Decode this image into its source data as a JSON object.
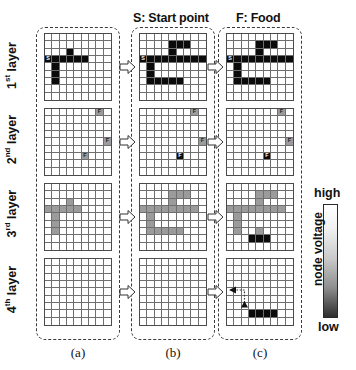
{
  "figure": {
    "top_captions": {
      "start": "S: Start point",
      "food": "F: Food"
    },
    "row_labels": [
      {
        "ordinal": "1",
        "suffix": "st",
        "text": " layer"
      },
      {
        "ordinal": "2",
        "suffix": "nd",
        "text": " layer"
      },
      {
        "ordinal": "3",
        "suffix": "rd",
        "text": " layer"
      },
      {
        "ordinal": "4",
        "suffix": "th",
        "text": " layer"
      }
    ],
    "bottom_captions": [
      "(a)",
      "(b)",
      "(c)"
    ],
    "legend": {
      "high_label": "high",
      "low_label": "low",
      "title": "node voltage",
      "high_color": "#ffffff",
      "low_color": "#2e2e2e"
    },
    "colors": {
      "black": "#0b0b0b",
      "gray": "#9b9b9b",
      "white": "#ffffff",
      "dashed_border": "#3a3a3a",
      "grid_line": "#6f6f6f"
    },
    "grid_size": {
      "cols": 9,
      "rows": 9
    },
    "marker_labels": {
      "start": "S",
      "food": "F"
    }
  },
  "grids": {
    "a1": {
      "name": "column-a-layer-1",
      "black": [
        [
          3,
          0
        ],
        [
          3,
          1
        ],
        [
          3,
          2
        ],
        [
          3,
          3
        ],
        [
          3,
          4
        ],
        [
          3,
          5
        ],
        [
          2,
          3
        ],
        [
          4,
          1
        ],
        [
          5,
          1
        ],
        [
          6,
          1
        ]
      ],
      "gray": [],
      "markers": [
        {
          "r": 3,
          "c": 0,
          "label": "S"
        }
      ]
    },
    "a2": {
      "name": "column-a-layer-2",
      "black": [],
      "gray": [
        [
          0,
          7
        ],
        [
          4,
          8
        ],
        [
          6,
          5
        ]
      ],
      "markers": [
        {
          "r": 0,
          "c": 7,
          "label": "F"
        },
        {
          "r": 4,
          "c": 8,
          "label": "F"
        },
        {
          "r": 6,
          "c": 5,
          "label": "F"
        }
      ]
    },
    "a3": {
      "name": "column-a-layer-3",
      "black": [],
      "gray": [
        [
          3,
          0
        ],
        [
          3,
          1
        ],
        [
          3,
          2
        ],
        [
          3,
          3
        ],
        [
          3,
          4
        ],
        [
          2,
          3
        ],
        [
          4,
          1
        ],
        [
          5,
          1
        ],
        [
          6,
          1
        ]
      ],
      "markers": []
    },
    "a4": {
      "name": "column-a-layer-4",
      "black": [],
      "gray": [],
      "markers": []
    },
    "b1": {
      "name": "column-b-layer-1",
      "black": [
        [
          1,
          4
        ],
        [
          1,
          5
        ],
        [
          1,
          6
        ],
        [
          2,
          4
        ],
        [
          3,
          0
        ],
        [
          3,
          1
        ],
        [
          3,
          2
        ],
        [
          3,
          3
        ],
        [
          3,
          4
        ],
        [
          3,
          5
        ],
        [
          3,
          6
        ],
        [
          3,
          7
        ],
        [
          3,
          8
        ],
        [
          4,
          1
        ],
        [
          5,
          1
        ],
        [
          6,
          1
        ],
        [
          6,
          2
        ],
        [
          6,
          3
        ],
        [
          6,
          4
        ],
        [
          6,
          5
        ]
      ],
      "gray": [],
      "markers": [
        {
          "r": 3,
          "c": 0,
          "label": "S"
        }
      ]
    },
    "b2": {
      "name": "column-b-layer-2",
      "black": [
        [
          6,
          5
        ]
      ],
      "gray": [
        [
          0,
          7
        ],
        [
          4,
          8
        ]
      ],
      "markers": [
        {
          "r": 0,
          "c": 7,
          "label": "F"
        },
        {
          "r": 4,
          "c": 8,
          "label": "F"
        },
        {
          "r": 6,
          "c": 5,
          "label": "F"
        }
      ]
    },
    "b3": {
      "name": "column-b-layer-3",
      "black": [],
      "gray": [
        [
          1,
          4
        ],
        [
          1,
          5
        ],
        [
          1,
          6
        ],
        [
          2,
          4
        ],
        [
          3,
          0
        ],
        [
          3,
          1
        ],
        [
          3,
          2
        ],
        [
          3,
          3
        ],
        [
          3,
          4
        ],
        [
          3,
          5
        ],
        [
          3,
          6
        ],
        [
          3,
          7
        ],
        [
          4,
          1
        ],
        [
          5,
          1
        ],
        [
          6,
          1
        ],
        [
          6,
          2
        ],
        [
          6,
          3
        ],
        [
          6,
          4
        ],
        [
          6,
          5
        ]
      ],
      "markers": []
    },
    "b4": {
      "name": "column-b-layer-4",
      "black": [],
      "gray": [],
      "markers": []
    },
    "c1": {
      "name": "column-c-layer-1",
      "black": [
        [
          1,
          4
        ],
        [
          1,
          5
        ],
        [
          1,
          6
        ],
        [
          2,
          4
        ],
        [
          3,
          0
        ],
        [
          3,
          1
        ],
        [
          3,
          2
        ],
        [
          3,
          3
        ],
        [
          3,
          4
        ],
        [
          3,
          5
        ],
        [
          3,
          6
        ],
        [
          3,
          7
        ],
        [
          3,
          8
        ],
        [
          4,
          1
        ],
        [
          5,
          1
        ],
        [
          6,
          1
        ],
        [
          6,
          2
        ],
        [
          6,
          3
        ],
        [
          6,
          4
        ],
        [
          6,
          5
        ]
      ],
      "gray": [],
      "markers": [
        {
          "r": 3,
          "c": 0,
          "label": "S"
        }
      ]
    },
    "c2": {
      "name": "column-c-layer-2",
      "black": [
        [
          6,
          5
        ]
      ],
      "gray": [
        [
          0,
          7
        ],
        [
          4,
          8
        ]
      ],
      "markers": [
        {
          "r": 0,
          "c": 7,
          "label": "F"
        },
        {
          "r": 4,
          "c": 8,
          "label": "F"
        },
        {
          "r": 6,
          "c": 5,
          "label": "F"
        }
      ]
    },
    "c3": {
      "name": "column-c-layer-3",
      "black": [
        [
          7,
          3
        ],
        [
          7,
          4
        ],
        [
          7,
          5
        ]
      ],
      "gray": [
        [
          1,
          4
        ],
        [
          1,
          5
        ],
        [
          1,
          6
        ],
        [
          2,
          4
        ],
        [
          3,
          0
        ],
        [
          3,
          1
        ],
        [
          3,
          2
        ],
        [
          3,
          3
        ],
        [
          3,
          4
        ],
        [
          3,
          5
        ],
        [
          3,
          6
        ],
        [
          3,
          7
        ],
        [
          4,
          1
        ],
        [
          5,
          1
        ],
        [
          6,
          1
        ],
        [
          6,
          4
        ]
      ],
      "markers": []
    },
    "c4": {
      "name": "column-c-layer-4",
      "black": [
        [
          7,
          3
        ],
        [
          7,
          4
        ],
        [
          7,
          5
        ],
        [
          7,
          6
        ]
      ],
      "gray": [],
      "markers": [],
      "path": {
        "left_arrow_row": 4,
        "left_arrow_col": 1,
        "up_arrow_row": 6,
        "up_arrow_col": 2,
        "dotted": true
      }
    }
  }
}
